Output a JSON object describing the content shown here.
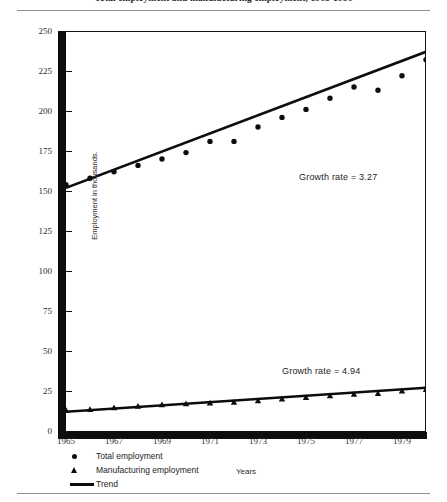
{
  "figure": {
    "title": "Total employment and manufacturing employment, 1965-1980",
    "xlabel": "Years",
    "ylabel": "Employment in thousands."
  },
  "annotations": {
    "total_growth": "Growth rate = 3.27",
    "manufacturing_growth": "Growth rate = 4.94"
  },
  "legend": {
    "items": [
      {
        "marker": "dot",
        "label": "Total employment"
      },
      {
        "marker": "triangle",
        "label": "Manufacturing employment"
      },
      {
        "marker": "line",
        "label": "Trend"
      }
    ]
  },
  "axis": {
    "y_ticks": [
      "250",
      "225",
      "200",
      "175",
      "150",
      "125",
      "100",
      "75",
      "50",
      "25",
      "0"
    ],
    "x_ticks": [
      "1965",
      "1967",
      "1969",
      "1971",
      "1973",
      "1975",
      "1977",
      "1979"
    ]
  },
  "chart_data": {
    "type": "scatter",
    "title": "Total employment and manufacturing employment, 1965-1980",
    "xlabel": "Years",
    "ylabel": "Employment in thousands.",
    "xlim": [
      1965,
      1980
    ],
    "ylim": [
      0,
      250
    ],
    "ytick_values": [
      0,
      25,
      50,
      75,
      100,
      125,
      150,
      175,
      200,
      225,
      250
    ],
    "xtick_values": [
      1965,
      1967,
      1969,
      1971,
      1973,
      1975,
      1977,
      1979
    ],
    "xtick_minor_every": 1,
    "grid": false,
    "legend_position": "below-axes-left",
    "x": [
      1965,
      1966,
      1967,
      1968,
      1969,
      1970,
      1971,
      1972,
      1973,
      1974,
      1975,
      1976,
      1977,
      1978,
      1979,
      1980
    ],
    "series": [
      {
        "name": "Total employment",
        "marker": "dot",
        "values": [
          154,
          158,
          162,
          166,
          170,
          174,
          181,
          181,
          190,
          196,
          201,
          208,
          215,
          213,
          222,
          232
        ],
        "trend": {
          "name": "Trend",
          "growth_rate": 3.27,
          "start": [
            1965,
            152
          ],
          "end": [
            1980,
            237
          ]
        }
      },
      {
        "name": "Manufacturing employment",
        "marker": "triangle",
        "values": [
          13,
          13.5,
          14.5,
          15.5,
          16.5,
          17,
          17.5,
          18,
          19,
          20,
          21,
          22,
          23,
          23.5,
          25,
          26
        ],
        "trend": {
          "name": "Trend",
          "growth_rate": 4.94,
          "start": [
            1965,
            12
          ],
          "end": [
            1980,
            27
          ]
        }
      }
    ],
    "annotations": [
      {
        "text": "Growth rate = 3.27",
        "series": "Total employment"
      },
      {
        "text": "Growth rate = 4.94",
        "series": "Manufacturing employment"
      }
    ]
  }
}
